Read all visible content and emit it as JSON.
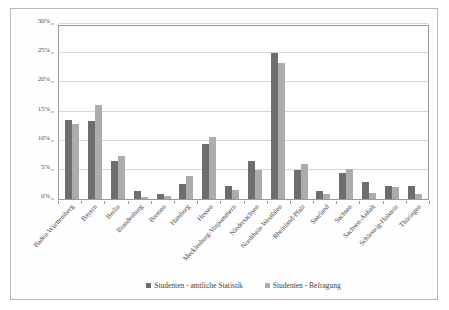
{
  "chart_data": {
    "type": "bar",
    "title": "",
    "subtitle": "",
    "xlabel": "",
    "ylabel": "",
    "ylim": [
      0,
      30
    ],
    "yticks": [
      0,
      5,
      10,
      15,
      20,
      25,
      30
    ],
    "ytick_labels": [
      "0%",
      "5%",
      "10%",
      "15%",
      "20%",
      "25%",
      "30%"
    ],
    "grid": true,
    "legend_position": "bottom",
    "categories": [
      "Baden-Württemberg",
      "Bayern",
      "Berlin",
      "Brandenburg",
      "Bremen",
      "Hamburg",
      "Hessen",
      "Mecklenburg-Vorpommern",
      "Niedersachsen",
      "Nordrhein-Westfalen",
      "Rheinland-Pfalz",
      "Saarland",
      "Sachsen",
      "Sachsen-Anhalt",
      "Schleswig-Holstein",
      "Thüringen"
    ],
    "series": [
      {
        "name": "Studenten - amtliche Statistik",
        "color": "#6e6e6e",
        "values": [
          13.5,
          13.4,
          6.5,
          1.3,
          0.9,
          2.5,
          9.5,
          2.3,
          6.6,
          25.0,
          4.9,
          1.4,
          4.5,
          2.9,
          2.2,
          2.2
        ]
      },
      {
        "name": "Studenten - Befragung",
        "color": "#acacac",
        "values": [
          12.9,
          16.1,
          7.4,
          0.4,
          0.6,
          3.9,
          10.7,
          1.6,
          5.0,
          23.4,
          6.0,
          0.8,
          5.2,
          1.1,
          2.0,
          0.8
        ]
      }
    ]
  },
  "colors": {
    "series_0": "#6e6e6e",
    "series_1": "#acacac",
    "gridline": "#d6d6d6",
    "axis": "#9a9a9a",
    "frame": "#b9b9b9",
    "background": "#ffffff"
  }
}
